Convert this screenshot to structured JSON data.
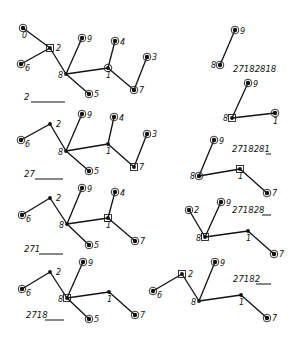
{
  "steps": [
    {
      "id": "step-1",
      "sequence_text": "2",
      "blank": {
        "x1": 31,
        "x2": 65,
        "y": 102
      },
      "seq_pos": {
        "x": 24,
        "y": 100
      },
      "nodes": [
        {
          "label": "0",
          "x": 23,
          "y": 28,
          "type": "leaf",
          "lx": -1,
          "ly": 10
        },
        {
          "label": "2",
          "x": 50,
          "y": 48,
          "type": "marked",
          "lx": 6,
          "ly": 3
        },
        {
          "label": "6",
          "x": 21,
          "y": 64,
          "type": "leaf",
          "lx": 4,
          "ly": 7
        },
        {
          "label": "8",
          "x": 66,
          "y": 74,
          "type": "internal",
          "lx": -8,
          "ly": 4
        },
        {
          "label": "9",
          "x": 82,
          "y": 38,
          "type": "leaf",
          "lx": 5,
          "ly": 4
        },
        {
          "label": "4",
          "x": 115,
          "y": 41,
          "type": "leaf",
          "lx": 5,
          "ly": 4
        },
        {
          "label": "1",
          "x": 108,
          "y": 68,
          "type": "ring",
          "lx": -2,
          "ly": 10
        },
        {
          "label": "3",
          "x": 147,
          "y": 57,
          "type": "leaf",
          "lx": 5,
          "ly": 3
        },
        {
          "label": "7",
          "x": 134,
          "y": 90,
          "type": "leaf",
          "lx": 5,
          "ly": 3
        },
        {
          "label": "5",
          "x": 89,
          "y": 94,
          "type": "leaf",
          "lx": 5,
          "ly": 3
        }
      ],
      "edges": [
        [
          "0",
          "2"
        ],
        [
          "2",
          "6"
        ],
        [
          "2",
          "8"
        ],
        [
          "8",
          "9"
        ],
        [
          "8",
          "5"
        ],
        [
          "8",
          "1"
        ],
        [
          "1",
          "4"
        ],
        [
          "1",
          "7"
        ],
        [
          "7",
          "3"
        ]
      ]
    },
    {
      "id": "step-2",
      "sequence_text": "27",
      "blank": {
        "x1": 35,
        "x2": 63,
        "y": 179
      },
      "seq_pos": {
        "x": 24,
        "y": 177
      },
      "nodes": [
        {
          "label": "2",
          "x": 50,
          "y": 124,
          "type": "internal",
          "lx": 6,
          "ly": 3
        },
        {
          "label": "6",
          "x": 21,
          "y": 140,
          "type": "leaf",
          "lx": 4,
          "ly": 7
        },
        {
          "label": "8",
          "x": 66,
          "y": 151,
          "type": "internal",
          "lx": -8,
          "ly": 4
        },
        {
          "label": "9",
          "x": 82,
          "y": 114,
          "type": "leaf",
          "lx": 5,
          "ly": 4
        },
        {
          "label": "4",
          "x": 114,
          "y": 117,
          "type": "leaf",
          "lx": 5,
          "ly": 4
        },
        {
          "label": "1",
          "x": 108,
          "y": 144,
          "type": "internal",
          "lx": -2,
          "ly": 10
        },
        {
          "label": "3",
          "x": 147,
          "y": 134,
          "type": "leaf",
          "lx": 5,
          "ly": 3
        },
        {
          "label": "7",
          "x": 134,
          "y": 167,
          "type": "marked",
          "lx": 5,
          "ly": 3
        },
        {
          "label": "5",
          "x": 89,
          "y": 171,
          "type": "leaf",
          "lx": 5,
          "ly": 3
        }
      ],
      "edges": [
        [
          "2",
          "6"
        ],
        [
          "2",
          "8"
        ],
        [
          "8",
          "9"
        ],
        [
          "8",
          "5"
        ],
        [
          "8",
          "1"
        ],
        [
          "1",
          "4"
        ],
        [
          "1",
          "7"
        ],
        [
          "7",
          "3"
        ]
      ]
    },
    {
      "id": "step-3",
      "sequence_text": "271",
      "blank": {
        "x1": 39,
        "x2": 63,
        "y": 254
      },
      "seq_pos": {
        "x": 24,
        "y": 252
      },
      "nodes": [
        {
          "label": "2",
          "x": 50,
          "y": 198,
          "type": "internal",
          "lx": 6,
          "ly": 3
        },
        {
          "label": "6",
          "x": 22,
          "y": 215,
          "type": "leaf",
          "lx": 4,
          "ly": 7
        },
        {
          "label": "8",
          "x": 67,
          "y": 224,
          "type": "internal",
          "lx": -8,
          "ly": 4
        },
        {
          "label": "9",
          "x": 82,
          "y": 188,
          "type": "leaf",
          "lx": 5,
          "ly": 4
        },
        {
          "label": "4",
          "x": 115,
          "y": 192,
          "type": "leaf",
          "lx": 5,
          "ly": 4
        },
        {
          "label": "1",
          "x": 108,
          "y": 218,
          "type": "marked",
          "lx": -2,
          "ly": 10
        },
        {
          "label": "7",
          "x": 135,
          "y": 241,
          "type": "leaf",
          "lx": 5,
          "ly": 3
        },
        {
          "label": "5",
          "x": 89,
          "y": 245,
          "type": "leaf",
          "lx": 5,
          "ly": 3
        }
      ],
      "edges": [
        [
          "2",
          "6"
        ],
        [
          "2",
          "8"
        ],
        [
          "8",
          "9"
        ],
        [
          "8",
          "5"
        ],
        [
          "8",
          "1"
        ],
        [
          "1",
          "4"
        ],
        [
          "1",
          "7"
        ]
      ]
    },
    {
      "id": "step-4",
      "sequence_text": "2718",
      "blank": {
        "x1": 45,
        "x2": 64,
        "y": 320
      },
      "seq_pos": {
        "x": 26,
        "y": 318
      },
      "nodes": [
        {
          "label": "2",
          "x": 50,
          "y": 272,
          "type": "internal",
          "lx": 6,
          "ly": 3
        },
        {
          "label": "6",
          "x": 22,
          "y": 289,
          "type": "leaf",
          "lx": 4,
          "ly": 7
        },
        {
          "label": "8",
          "x": 67,
          "y": 298,
          "type": "marked",
          "lx": -9,
          "ly": 4
        },
        {
          "label": "9",
          "x": 83,
          "y": 262,
          "type": "leaf",
          "lx": 5,
          "ly": 4
        },
        {
          "label": "1",
          "x": 109,
          "y": 292,
          "type": "internal",
          "lx": -2,
          "ly": 10
        },
        {
          "label": "7",
          "x": 135,
          "y": 315,
          "type": "leaf",
          "lx": 5,
          "ly": 3
        },
        {
          "label": "5",
          "x": 89,
          "y": 319,
          "type": "leaf",
          "lx": 5,
          "ly": 3
        }
      ],
      "edges": [
        [
          "2",
          "6"
        ],
        [
          "2",
          "8"
        ],
        [
          "8",
          "9"
        ],
        [
          "8",
          "5"
        ],
        [
          "8",
          "1"
        ],
        [
          "1",
          "7"
        ]
      ]
    },
    {
      "id": "step-5",
      "sequence_text": "27182",
      "blank": {
        "x1": 256,
        "x2": 271,
        "y": 284
      },
      "seq_pos": {
        "x": 233,
        "y": 282
      },
      "nodes": [
        {
          "label": "2",
          "x": 182,
          "y": 274,
          "type": "marked",
          "lx": 6,
          "ly": 3
        },
        {
          "label": "6",
          "x": 153,
          "y": 291,
          "type": "leaf",
          "lx": 4,
          "ly": 7
        },
        {
          "label": "8",
          "x": 199,
          "y": 301,
          "type": "internal",
          "lx": -8,
          "ly": 4
        },
        {
          "label": "9",
          "x": 215,
          "y": 262,
          "type": "leaf",
          "lx": 5,
          "ly": 4
        },
        {
          "label": "1",
          "x": 241,
          "y": 295,
          "type": "internal",
          "lx": -2,
          "ly": 10
        },
        {
          "label": "7",
          "x": 267,
          "y": 318,
          "type": "leaf",
          "lx": 5,
          "ly": 3
        }
      ],
      "edges": [
        [
          "2",
          "6"
        ],
        [
          "2",
          "8"
        ],
        [
          "8",
          "9"
        ],
        [
          "8",
          "1"
        ],
        [
          "1",
          "7"
        ]
      ]
    },
    {
      "id": "step-6",
      "sequence_text": "271828",
      "blank": {
        "x1": 262,
        "x2": 271,
        "y": 215
      },
      "seq_pos": {
        "x": 232,
        "y": 213
      },
      "nodes": [
        {
          "label": "2",
          "x": 189,
          "y": 210,
          "type": "leaf",
          "lx": 5,
          "ly": 3
        },
        {
          "label": "9",
          "x": 221,
          "y": 202,
          "type": "leaf",
          "lx": 5,
          "ly": 4
        },
        {
          "label": "8",
          "x": 205,
          "y": 237,
          "type": "marked",
          "lx": -9,
          "ly": 4
        },
        {
          "label": "1",
          "x": 248,
          "y": 231,
          "type": "internal",
          "lx": -2,
          "ly": 10
        },
        {
          "label": "7",
          "x": 274,
          "y": 254,
          "type": "leaf",
          "lx": 5,
          "ly": 3
        }
      ],
      "edges": [
        [
          "2",
          "8"
        ],
        [
          "8",
          "9"
        ],
        [
          "8",
          "1"
        ],
        [
          "1",
          "7"
        ]
      ]
    },
    {
      "id": "step-7",
      "sequence_text": "2718281",
      "blank": {
        "x1": 266,
        "x2": 271,
        "y": 154
      },
      "seq_pos": {
        "x": 232,
        "y": 152
      },
      "nodes": [
        {
          "label": "9",
          "x": 214,
          "y": 140,
          "type": "leaf",
          "lx": 5,
          "ly": 4
        },
        {
          "label": "8",
          "x": 199,
          "y": 176,
          "type": "leaf",
          "lx": -9,
          "ly": 3
        },
        {
          "label": "1",
          "x": 240,
          "y": 169,
          "type": "marked",
          "lx": -2,
          "ly": 10
        },
        {
          "label": "7",
          "x": 267,
          "y": 193,
          "type": "leaf",
          "lx": 5,
          "ly": 3
        }
      ],
      "edges": [
        [
          "8",
          "9"
        ],
        [
          "8",
          "1"
        ],
        [
          "1",
          "7"
        ]
      ]
    },
    {
      "id": "step-8",
      "sequence_text": "",
      "blank": null,
      "seq_pos": null,
      "nodes": [
        {
          "label": "9",
          "x": 248,
          "y": 83,
          "type": "leaf",
          "lx": 5,
          "ly": 4
        },
        {
          "label": "8",
          "x": 232,
          "y": 118,
          "type": "marked",
          "lx": -9,
          "ly": 3
        },
        {
          "label": "1",
          "x": 275,
          "y": 113,
          "type": "leaf",
          "lx": -2,
          "ly": 11
        }
      ],
      "edges": [
        [
          "8",
          "9"
        ],
        [
          "8",
          "1"
        ]
      ]
    },
    {
      "id": "step-9",
      "sequence_text": "27182818",
      "blank": null,
      "seq_pos": {
        "x": 233,
        "y": 72
      },
      "nodes": [
        {
          "label": "9",
          "x": 235,
          "y": 30,
          "type": "leaf",
          "lx": 5,
          "ly": 4
        },
        {
          "label": "8",
          "x": 220,
          "y": 65,
          "type": "leaf",
          "lx": -9,
          "ly": 3
        }
      ],
      "edges": [
        [
          "8",
          "9"
        ]
      ]
    }
  ],
  "legend": {
    "leaf": "circled node (leaf)",
    "marked": "boxed node (just removed/appended)",
    "internal": "plain dot"
  }
}
